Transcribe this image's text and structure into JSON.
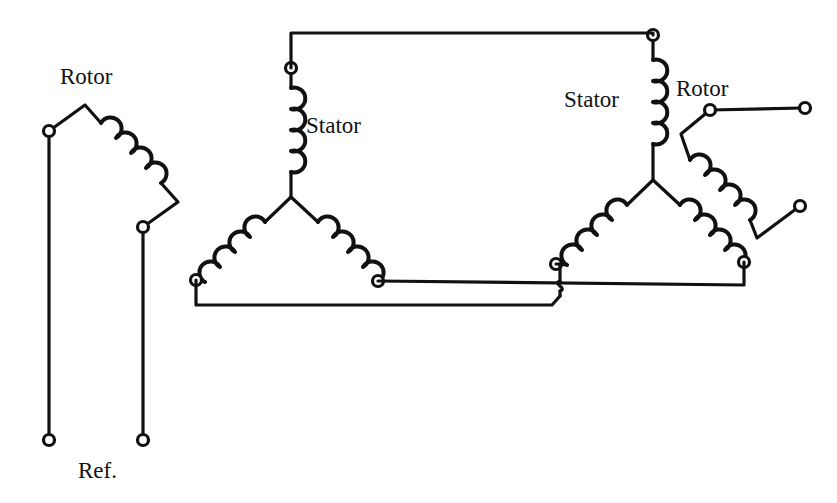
{
  "diagram": {
    "background_color": "#ffffff",
    "line_color": "#111111",
    "canvas": {
      "width": 837,
      "height": 503
    },
    "labels": [
      {
        "id": "rotor-left",
        "text": "Rotor",
        "x": 60,
        "y": 84,
        "anchor": "start"
      },
      {
        "id": "stator-left",
        "text": "Stator",
        "x": 306,
        "y": 133,
        "anchor": "start"
      },
      {
        "id": "stator-right",
        "text": "Stator",
        "x": 564,
        "y": 107,
        "anchor": "start"
      },
      {
        "id": "rotor-right",
        "text": "Rotor",
        "x": 676,
        "y": 96,
        "anchor": "start"
      },
      {
        "id": "reference",
        "text": "Ref.",
        "x": 78,
        "y": 478,
        "anchor": "start"
      }
    ],
    "terminals": [
      {
        "id": "rotor-left-top",
        "x": 49,
        "y": 131,
        "r": 5.5
      },
      {
        "id": "rotor-left-mid",
        "x": 143,
        "y": 227,
        "r": 5.5
      },
      {
        "id": "rotor-left-ref-a",
        "x": 49,
        "y": 440,
        "r": 5.5
      },
      {
        "id": "rotor-left-ref-b",
        "x": 143,
        "y": 440,
        "r": 5.5
      },
      {
        "id": "stator-left-top",
        "x": 291,
        "y": 68,
        "r": 5.5
      },
      {
        "id": "stator-left-bot-left",
        "x": 196,
        "y": 280,
        "r": 5.5
      },
      {
        "id": "stator-left-bot-right",
        "x": 378,
        "y": 281,
        "r": 5.5
      },
      {
        "id": "stator-right-top",
        "x": 653,
        "y": 35,
        "r": 5.5
      },
      {
        "id": "stator-right-bot-left",
        "x": 556,
        "y": 264,
        "r": 5.5
      },
      {
        "id": "stator-right-bot-right",
        "x": 744,
        "y": 262,
        "r": 5.5
      },
      {
        "id": "rotor-right-top",
        "x": 710,
        "y": 110,
        "r": 5.5
      },
      {
        "id": "rotor-right-lead-end",
        "x": 805,
        "y": 108,
        "r": 5.5
      },
      {
        "id": "rotor-right-bot",
        "x": 800,
        "y": 206,
        "r": 5.5
      }
    ],
    "coils": [
      {
        "id": "rotor-left-coil",
        "loops": 4,
        "orientation": "diagonal-down-right"
      },
      {
        "id": "stator-left-coil-top",
        "loops": 4,
        "orientation": "vertical"
      },
      {
        "id": "stator-left-coil-bleft",
        "loops": 4,
        "orientation": "diagonal-down-left"
      },
      {
        "id": "stator-left-coil-bright",
        "loops": 4,
        "orientation": "diagonal-down-right"
      },
      {
        "id": "stator-right-coil-top",
        "loops": 4,
        "orientation": "vertical"
      },
      {
        "id": "stator-right-coil-bleft",
        "loops": 4,
        "orientation": "diagonal-down-left"
      },
      {
        "id": "stator-right-coil-bright",
        "loops": 4,
        "orientation": "diagonal-down-right"
      },
      {
        "id": "rotor-right-coil",
        "loops": 4,
        "orientation": "diagonal-down-left"
      }
    ],
    "connections": [
      {
        "id": "top-bus",
        "from": "stator-left-top",
        "to": "stator-right-top",
        "style": "orthogonal"
      },
      {
        "id": "bottom-bus",
        "from": "stator-left-bot-left",
        "to": "stator-right-bot-left",
        "style": "orthogonal-with-hop"
      },
      {
        "id": "middle-bus",
        "from": "stator-left-bot-right",
        "to": "stator-right-bot-right",
        "style": "straight"
      }
    ],
    "wire_hop": {
      "id": "crossover-hop",
      "x": 560,
      "y": 287,
      "note": "non-connecting wire crossover"
    }
  }
}
